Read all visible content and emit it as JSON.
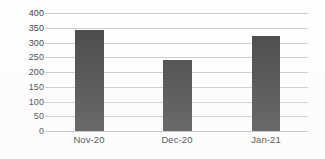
{
  "chart_data": {
    "type": "bar",
    "title": "",
    "xlabel": "",
    "ylabel": "",
    "categories": [
      "Nov-20",
      "Dec-20",
      "Jan-21"
    ],
    "values": [
      344,
      242,
      322
    ],
    "series": [
      {
        "name": "",
        "values": [
          344,
          242,
          322
        ]
      }
    ],
    "ylim": [
      0,
      400
    ],
    "ytick_labels": [
      "0",
      "50",
      "100",
      "150",
      "200",
      "250",
      "300",
      "350",
      "400"
    ],
    "ytick_values": [
      0,
      50,
      100,
      150,
      200,
      250,
      300,
      350,
      400
    ],
    "ytick_step": 50,
    "grid": true,
    "grid_axis": "y",
    "legend": false,
    "legend_position": "none",
    "bar_color": "#454545",
    "gridline_color": "#c9c9c9",
    "axis_color": "#bdbdbd",
    "label_color": "#3b3b3b",
    "background_color": "#fefefe"
  }
}
